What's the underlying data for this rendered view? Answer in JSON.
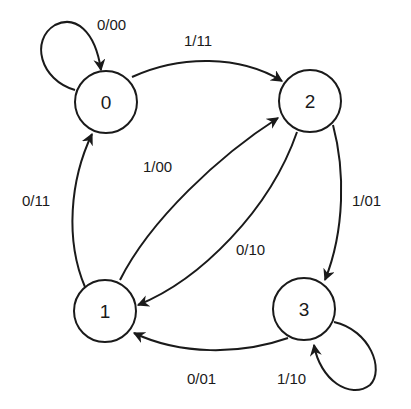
{
  "diagram": {
    "type": "state-machine",
    "colors": {
      "stroke": "#1a1a1a",
      "background": "#ffffff"
    },
    "states": [
      {
        "id": "0",
        "label": "0"
      },
      {
        "id": "1",
        "label": "1"
      },
      {
        "id": "2",
        "label": "2"
      },
      {
        "id": "3",
        "label": "3"
      }
    ],
    "transitions": [
      {
        "from": "0",
        "to": "0",
        "label": "0/00"
      },
      {
        "from": "0",
        "to": "2",
        "label": "1/11"
      },
      {
        "from": "1",
        "to": "0",
        "label": "0/11"
      },
      {
        "from": "1",
        "to": "2",
        "label": "1/00"
      },
      {
        "from": "2",
        "to": "1",
        "label": "0/10"
      },
      {
        "from": "2",
        "to": "3",
        "label": "1/01"
      },
      {
        "from": "3",
        "to": "1",
        "label": "0/01"
      },
      {
        "from": "3",
        "to": "3",
        "label": "1/10"
      }
    ]
  }
}
